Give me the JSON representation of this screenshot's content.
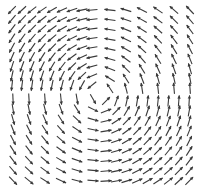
{
  "chart_data": {
    "type": "quiver",
    "title": "",
    "xlabel": "",
    "ylabel": "",
    "grid": false,
    "legend": null,
    "arrow_color": "#3a3a3a",
    "background": "#ffffff",
    "center": [
      100,
      95
    ],
    "panels": [
      {
        "name": "top-left",
        "cols": 9,
        "rows": 9,
        "x_start": 12,
        "x_step": 10,
        "y_start": 10,
        "y_step": 9.4,
        "direction_summary": "north to north-east"
      },
      {
        "name": "top-right",
        "cols": 6,
        "rows": 9,
        "x_start": 110,
        "x_step": 16,
        "y_start": 10,
        "y_step": 9.8,
        "direction_summary": "east to south-south-east"
      },
      {
        "name": "bottom-left",
        "cols": 6,
        "rows": 9,
        "x_start": 13,
        "x_step": 16,
        "y_start": 99,
        "y_step": 10.2,
        "direction_summary": "north-north-west to west"
      },
      {
        "name": "bottom-right",
        "cols": 9,
        "rows": 9,
        "x_start": 106,
        "x_step": 10.4,
        "y_start": 101,
        "y_step": 10,
        "direction_summary": "south to west-south-west"
      }
    ],
    "arrow_length": 11,
    "head_size": 3
  }
}
